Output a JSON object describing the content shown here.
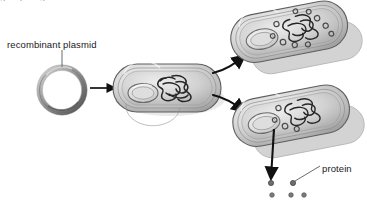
{
  "figure": {
    "background_color": "#ffffff",
    "width": 367,
    "height": 208,
    "clipped_top_text": "g p g"
  },
  "labels": {
    "recombinant_plasmid": "recombinant plasmid",
    "protein": "protein"
  },
  "colors": {
    "line": "#111111",
    "cell_fill_light": "#e8e8e8",
    "cell_fill_mid": "#c9c9c9",
    "cell_fill_dark": "#a8a8a8",
    "cell_outline": "#5c5c5c",
    "dna_stroke": "#2a2a2a",
    "shadow": "#bdbdbd",
    "protein_dot": "#6f6f6f",
    "text": "#1a1a1a"
  },
  "elements": {
    "plasmid_ring": {
      "name": "recombinant plasmid",
      "cx": 62,
      "cy": 90,
      "r_outer": 23,
      "r_inner": 17
    },
    "leader_line_plasmid": {
      "from_x": 62,
      "from_y": 50,
      "to_x": 62,
      "to_y": 67
    },
    "arrow_uptake": {
      "type": "straight",
      "from_x": 92,
      "from_y": 88,
      "to_x": 118,
      "to_y": 88
    },
    "bacterium_center": {
      "name": "transformed bacterium",
      "cx": 167,
      "cy": 88,
      "width": 108,
      "height": 48,
      "contents": [
        "plasmid ring",
        "chromosome"
      ]
    },
    "arrow_to_upper_cell": {
      "type": "curved",
      "from_x": 212,
      "from_y": 72,
      "to_x": 250,
      "to_y": 54
    },
    "arrow_to_lower_cell": {
      "type": "curved",
      "from_x": 212,
      "from_y": 96,
      "to_x": 250,
      "to_y": 112
    },
    "bacterium_upper_right": {
      "name": "bacterium with replicated plasmids",
      "cx": 290,
      "cy": 32,
      "width": 116,
      "height": 50,
      "plasmid_copies": 10,
      "has_shadow_cell": true
    },
    "bacterium_lower_right": {
      "name": "bacterium expressing protein",
      "cx": 292,
      "cy": 116,
      "width": 116,
      "height": 50,
      "plasmid_copies": 4,
      "has_shadow_cell": true
    },
    "arrow_protein_secretion": {
      "type": "straight",
      "from_x": 273,
      "from_y": 131,
      "to_x": 271,
      "to_y": 180
    },
    "leader_line_protein": {
      "from_x": 320,
      "from_y": 166,
      "to_x": 294,
      "to_y": 182
    },
    "protein_dots": [
      {
        "cx": 271,
        "cy": 183,
        "r": 2.6
      },
      {
        "cx": 293,
        "cy": 183,
        "r": 2.6
      },
      {
        "cx": 272,
        "cy": 195,
        "r": 2.3
      },
      {
        "cx": 291,
        "cy": 195,
        "r": 2.3
      },
      {
        "cx": 304,
        "cy": 195,
        "r": 2.3
      }
    ]
  }
}
